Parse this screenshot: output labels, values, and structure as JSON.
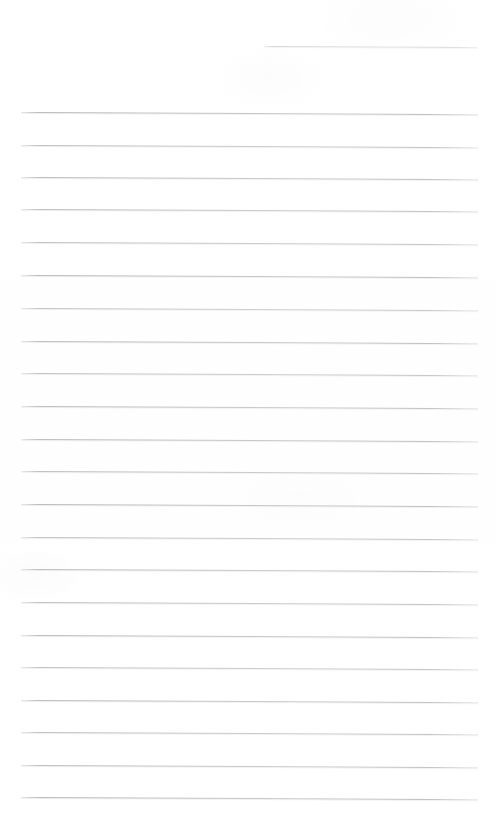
{
  "document": {
    "kind": "scanned-lined-paper",
    "title": "Blank ruled notebook page",
    "page_width": 496,
    "page_height": 828,
    "background_color": "#ffffff",
    "rule_color": "#b0b5ba",
    "rule_thickness_px": 1,
    "rule_spacing_px": 32.65,
    "slant_degrees": 0.27,
    "content_text": "",
    "margin_left_px": 21,
    "margin_right_px": 477
  },
  "rules": [
    {
      "id": "rule-1",
      "x": 264,
      "y": 46,
      "width": 214,
      "slant": 0.27,
      "opacity": 0.55,
      "partial": true
    },
    {
      "id": "rule-2",
      "x": 21,
      "y": 112,
      "width": 457,
      "slant": 0.27,
      "opacity": 0.95,
      "partial": false
    },
    {
      "id": "rule-3",
      "x": 21,
      "y": 145,
      "width": 457,
      "slant": 0.27,
      "opacity": 0.88,
      "partial": false
    },
    {
      "id": "rule-4",
      "x": 21,
      "y": 177,
      "width": 457,
      "slant": 0.27,
      "opacity": 0.92,
      "partial": false
    },
    {
      "id": "rule-5",
      "x": 21,
      "y": 209,
      "width": 457,
      "slant": 0.27,
      "opacity": 0.9,
      "partial": false
    },
    {
      "id": "rule-6",
      "x": 21,
      "y": 242,
      "width": 457,
      "slant": 0.27,
      "opacity": 0.86,
      "partial": false
    },
    {
      "id": "rule-7",
      "x": 21,
      "y": 275,
      "width": 457,
      "slant": 0.27,
      "opacity": 0.95,
      "partial": false
    },
    {
      "id": "rule-8",
      "x": 21,
      "y": 308,
      "width": 457,
      "slant": 0.27,
      "opacity": 0.82,
      "partial": false
    },
    {
      "id": "rule-9",
      "x": 21,
      "y": 341,
      "width": 457,
      "slant": 0.27,
      "opacity": 0.93,
      "partial": false
    },
    {
      "id": "rule-10",
      "x": 21,
      "y": 373,
      "width": 457,
      "slant": 0.27,
      "opacity": 0.85,
      "partial": false
    },
    {
      "id": "rule-11",
      "x": 21,
      "y": 406,
      "width": 457,
      "slant": 0.27,
      "opacity": 0.9,
      "partial": false
    },
    {
      "id": "rule-12",
      "x": 21,
      "y": 439,
      "width": 457,
      "slant": 0.27,
      "opacity": 0.92,
      "partial": false
    },
    {
      "id": "rule-13",
      "x": 21,
      "y": 471,
      "width": 457,
      "slant": 0.27,
      "opacity": 0.88,
      "partial": false
    },
    {
      "id": "rule-14",
      "x": 21,
      "y": 504,
      "width": 457,
      "slant": 0.27,
      "opacity": 0.94,
      "partial": false
    },
    {
      "id": "rule-15",
      "x": 21,
      "y": 537,
      "width": 457,
      "slant": 0.27,
      "opacity": 0.86,
      "partial": false
    },
    {
      "id": "rule-16",
      "x": 21,
      "y": 569,
      "width": 457,
      "slant": 0.27,
      "opacity": 0.9,
      "partial": false
    },
    {
      "id": "rule-17",
      "x": 21,
      "y": 602,
      "width": 457,
      "slant": 0.27,
      "opacity": 0.88,
      "partial": false
    },
    {
      "id": "rule-18",
      "x": 21,
      "y": 635,
      "width": 457,
      "slant": 0.27,
      "opacity": 0.93,
      "partial": false
    },
    {
      "id": "rule-19",
      "x": 21,
      "y": 667,
      "width": 457,
      "slant": 0.27,
      "opacity": 0.85,
      "partial": false
    },
    {
      "id": "rule-20",
      "x": 21,
      "y": 700,
      "width": 457,
      "slant": 0.27,
      "opacity": 0.92,
      "partial": false
    },
    {
      "id": "rule-21",
      "x": 21,
      "y": 732,
      "width": 457,
      "slant": 0.27,
      "opacity": 0.88,
      "partial": false
    },
    {
      "id": "rule-22",
      "x": 21,
      "y": 765,
      "width": 457,
      "slant": 0.27,
      "opacity": 0.9,
      "partial": false
    },
    {
      "id": "rule-23",
      "x": 21,
      "y": 797,
      "width": 457,
      "slant": 0.27,
      "opacity": 0.95,
      "partial": false
    }
  ]
}
